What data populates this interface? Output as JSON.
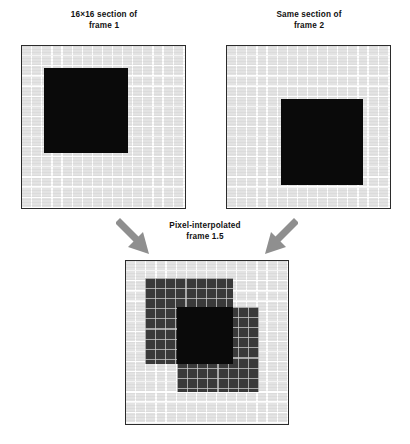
{
  "figure": {
    "panels": [
      {
        "id": "frame-1",
        "caption": "16×16 section of\nframe 1",
        "grid": {
          "columns": 16,
          "rows": 16
        },
        "background_color": "#e3e3e3",
        "gridline_color": "#ffffff",
        "border_color": "#2b2b2b",
        "blocks": [
          {
            "name": "solid-black-square",
            "fill_color": "#0a0a0a",
            "grid_x": 2,
            "grid_y": 2,
            "grid_width": 8,
            "grid_height": 8
          }
        ]
      },
      {
        "id": "frame-2",
        "caption": "Same section of\nframe 2",
        "grid": {
          "columns": 16,
          "rows": 16
        },
        "background_color": "#e3e3e3",
        "gridline_color": "#ffffff",
        "border_color": "#2b2b2b",
        "blocks": [
          {
            "name": "solid-black-square",
            "fill_color": "#0a0a0a",
            "grid_x": 5,
            "grid_y": 5,
            "grid_width": 8,
            "grid_height": 8
          }
        ]
      },
      {
        "id": "frame-1-point-5",
        "caption": "Pixel-interpolated\nframe 1.5",
        "grid": {
          "columns": 16,
          "rows": 16
        },
        "background_color": "#e3e3e3",
        "gridline_color": "#ffffff",
        "border_color": "#2b2b2b",
        "blocks": [
          {
            "name": "ghost-square-from-frame-1",
            "fill_color": "#3a3a3a",
            "grid_x": 2,
            "grid_y": 2,
            "grid_width": 8,
            "grid_height": 8
          },
          {
            "name": "ghost-square-from-frame-2",
            "fill_color": "#3a3a3a",
            "grid_x": 5,
            "grid_y": 5,
            "grid_width": 8,
            "grid_height": 8
          },
          {
            "name": "overlap-region",
            "fill_color": "#0a0a0a",
            "grid_x": 5,
            "grid_y": 5,
            "grid_width": 5,
            "grid_height": 5
          }
        ]
      }
    ],
    "arrows": [
      {
        "name": "arrow-from-frame-1",
        "direction": "down-right",
        "color": "#8a8a8a"
      },
      {
        "name": "arrow-from-frame-2",
        "direction": "down-left",
        "color": "#8a8a8a"
      }
    ]
  }
}
